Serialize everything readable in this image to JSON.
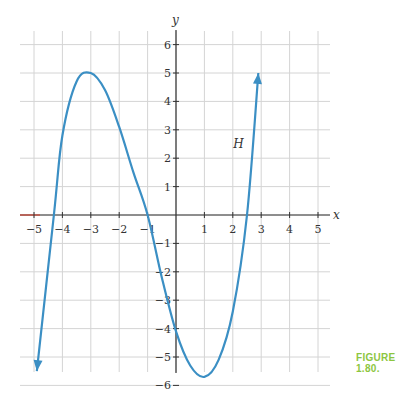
{
  "figure_caption": "FIGURE 1.80.",
  "chart_data": {
    "type": "line",
    "title": "",
    "xlabel": "x",
    "ylabel": "y",
    "xlim": [
      -5.5,
      5.5
    ],
    "ylim": [
      -6.5,
      6.5
    ],
    "grid": true,
    "x_ticks": [
      -5,
      -4,
      -3,
      -2,
      -1,
      1,
      2,
      3,
      4,
      5
    ],
    "y_ticks": [
      -6,
      -5,
      -4,
      -3,
      -2,
      -1,
      1,
      2,
      3,
      4,
      5,
      6
    ],
    "series": [
      {
        "name": "H",
        "color": "#3b8fc4",
        "x": [
          -4.9,
          -4.3,
          -4.0,
          -3.5,
          -3.0,
          -2.5,
          -2.0,
          -1.5,
          -1.0,
          -0.5,
          0.0,
          0.5,
          1.0,
          1.5,
          2.0,
          2.5,
          2.9
        ],
        "values": [
          -5.5,
          0.0,
          2.8,
          4.7,
          5.0,
          4.4,
          3.1,
          1.5,
          0.0,
          -2.2,
          -4.1,
          -5.3,
          -5.7,
          -5.1,
          -3.4,
          0.0,
          5.0
        ],
        "arrows": "both ends"
      }
    ],
    "annotations": [
      {
        "text": "H",
        "x": 2.3,
        "y": 2.5
      }
    ]
  }
}
